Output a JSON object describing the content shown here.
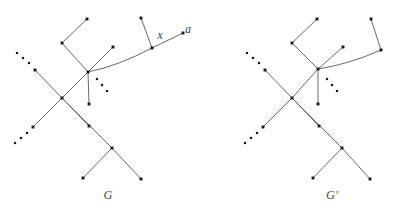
{
  "figure": {
    "width": 393,
    "height": 213,
    "background": "#ffffff",
    "edge_color": "#57575c",
    "node_color": "#18181c",
    "label_color": "#3a3a40"
  },
  "labels": {
    "vertex_x": "x",
    "vertex_a": "a",
    "caption_left": "G",
    "caption_right": "G′"
  },
  "graphs": [
    {
      "id": "graph-G",
      "caption": "G",
      "caption_pos": [
        108,
        199
      ],
      "hub": [
        88,
        72
      ],
      "nodes": [
        {
          "name": "upper-left-leaf",
          "pos": [
            87,
            19
          ]
        },
        {
          "name": "upper-left-elbow",
          "pos": [
            62,
            43
          ]
        },
        {
          "name": "upper-mid-leaf",
          "pos": [
            113,
            47
          ]
        },
        {
          "name": "hub",
          "pos": [
            88,
            72
          ]
        },
        {
          "name": "stem-leaf",
          "pos": [
            89,
            104
          ]
        },
        {
          "name": "branch-x",
          "pos": [
            152,
            48
          ]
        },
        {
          "name": "leaf-above-x",
          "pos": [
            141,
            18
          ]
        },
        {
          "name": "vertex-a",
          "pos": [
            183,
            33
          ]
        },
        {
          "name": "upper-chain-node",
          "pos": [
            35,
            70
          ]
        },
        {
          "name": "crossing-node",
          "pos": [
            62,
            98
          ]
        },
        {
          "name": "lower-chain-node",
          "pos": [
            33,
            127
          ]
        },
        {
          "name": "mid-lower-node",
          "pos": [
            89,
            126
          ]
        },
        {
          "name": "fork-node",
          "pos": [
            112,
            148
          ]
        },
        {
          "name": "fork-leaf-left",
          "pos": [
            83,
            178
          ]
        },
        {
          "name": "fork-leaf-right",
          "pos": [
            141,
            179
          ]
        }
      ],
      "edges": [
        {
          "name": "edge-upperleft-leaf-elbow",
          "from": [
            87,
            19
          ],
          "to": [
            62,
            43
          ]
        },
        {
          "name": "edge-elbow-hub",
          "from": [
            62,
            43
          ],
          "to": [
            88,
            72
          ]
        },
        {
          "name": "edge-uppermid-leaf-hub",
          "from": [
            113,
            47
          ],
          "to": [
            88,
            72
          ]
        },
        {
          "name": "edge-hub-stem-leaf",
          "from": [
            88,
            72
          ],
          "to": [
            89,
            104
          ]
        },
        {
          "name": "edge-leaf-above-x",
          "from": [
            141,
            18
          ],
          "to": [
            152,
            48
          ]
        },
        {
          "name": "edge-x-to-a",
          "from": [
            152,
            48
          ],
          "to": [
            183,
            33
          ]
        },
        {
          "name": "edge-hub-to-x-curve",
          "from": [
            88,
            72
          ],
          "to": [
            152,
            48
          ],
          "curve": [
            118,
            66
          ]
        },
        {
          "name": "edge-upperchain-crossing",
          "from": [
            35,
            70
          ],
          "to": [
            62,
            98
          ]
        },
        {
          "name": "edge-crossing-hub",
          "from": [
            62,
            98
          ],
          "to": [
            88,
            72
          ]
        },
        {
          "name": "edge-crossing-lowerchain",
          "from": [
            62,
            98
          ],
          "to": [
            33,
            127
          ]
        },
        {
          "name": "edge-crossing-midlower",
          "from": [
            62,
            98
          ],
          "to": [
            112,
            148
          ]
        },
        {
          "name": "edge-midlower-hub-diag",
          "from": [
            89,
            126
          ],
          "to": [
            62,
            98
          ]
        },
        {
          "name": "edge-fork-leaf-left",
          "from": [
            112,
            148
          ],
          "to": [
            83,
            178
          ]
        },
        {
          "name": "edge-fork-leaf-right",
          "from": [
            112,
            148
          ],
          "to": [
            141,
            179
          ]
        }
      ],
      "ellipses": [
        {
          "name": "ellipsis-upper-left",
          "dots": [
            [
              17,
              53
            ],
            [
              23,
              58
            ],
            [
              29,
              63
            ]
          ]
        },
        {
          "name": "ellipsis-lower-left",
          "dots": [
            [
              27,
              133
            ],
            [
              21,
              138
            ],
            [
              15,
              143
            ]
          ]
        },
        {
          "name": "ellipsis-hub-right",
          "dots": [
            [
              97,
              79
            ],
            [
              102,
              85
            ],
            [
              107,
              91
            ]
          ]
        }
      ]
    },
    {
      "id": "graph-G-prime",
      "caption": "G′",
      "caption_pos": [
        332,
        199
      ],
      "hub": [
        318,
        69
      ],
      "nodes": [
        {
          "name": "upper-left-leaf",
          "pos": [
            317,
            19
          ]
        },
        {
          "name": "upper-left-elbow",
          "pos": [
            292,
            43
          ]
        },
        {
          "name": "upper-mid-leaf",
          "pos": [
            343,
            47
          ]
        },
        {
          "name": "hub",
          "pos": [
            318,
            69
          ]
        },
        {
          "name": "stem-leaf",
          "pos": [
            318,
            104
          ]
        },
        {
          "name": "right-bend-node",
          "pos": [
            381,
            50
          ]
        },
        {
          "name": "right-top-leaf",
          "pos": [
            371,
            19
          ]
        },
        {
          "name": "upper-chain-node",
          "pos": [
            265,
            70
          ]
        },
        {
          "name": "crossing-node",
          "pos": [
            292,
            98
          ]
        },
        {
          "name": "lower-chain-node",
          "pos": [
            263,
            127
          ]
        },
        {
          "name": "mid-lower-node",
          "pos": [
            319,
            126
          ]
        },
        {
          "name": "fork-node",
          "pos": [
            342,
            148
          ]
        },
        {
          "name": "fork-leaf-left",
          "pos": [
            313,
            178
          ]
        },
        {
          "name": "fork-leaf-right",
          "pos": [
            370,
            179
          ]
        }
      ],
      "edges": [
        {
          "name": "edge-upperleft-leaf-elbow",
          "from": [
            317,
            19
          ],
          "to": [
            292,
            43
          ]
        },
        {
          "name": "edge-elbow-hub",
          "from": [
            292,
            43
          ],
          "to": [
            318,
            69
          ]
        },
        {
          "name": "edge-uppermid-leaf-hub",
          "from": [
            343,
            47
          ],
          "to": [
            318,
            69
          ]
        },
        {
          "name": "edge-hub-stem-leaf",
          "from": [
            318,
            69
          ],
          "to": [
            318,
            104
          ]
        },
        {
          "name": "edge-right-top-leaf-bend",
          "from": [
            371,
            19
          ],
          "to": [
            381,
            50
          ]
        },
        {
          "name": "edge-hub-to-bend-curve",
          "from": [
            318,
            69
          ],
          "to": [
            381,
            50
          ],
          "curve": [
            350,
            64
          ]
        },
        {
          "name": "edge-upperchain-crossing",
          "from": [
            265,
            70
          ],
          "to": [
            292,
            98
          ]
        },
        {
          "name": "edge-crossing-hub",
          "from": [
            292,
            98
          ],
          "to": [
            318,
            69
          ]
        },
        {
          "name": "edge-crossing-lowerchain",
          "from": [
            292,
            98
          ],
          "to": [
            263,
            127
          ]
        },
        {
          "name": "edge-crossing-midlower",
          "from": [
            292,
            98
          ],
          "to": [
            342,
            148
          ]
        },
        {
          "name": "edge-midlower-crossing",
          "from": [
            319,
            126
          ],
          "to": [
            292,
            98
          ]
        },
        {
          "name": "edge-fork-leaf-left",
          "from": [
            342,
            148
          ],
          "to": [
            313,
            178
          ]
        },
        {
          "name": "edge-fork-leaf-right",
          "from": [
            342,
            148
          ],
          "to": [
            370,
            179
          ]
        }
      ],
      "ellipses": [
        {
          "name": "ellipsis-upper-left",
          "dots": [
            [
              247,
              53
            ],
            [
              253,
              58
            ],
            [
              259,
              63
            ]
          ]
        },
        {
          "name": "ellipsis-lower-left",
          "dots": [
            [
              257,
              133
            ],
            [
              251,
              138
            ],
            [
              245,
              143
            ]
          ]
        },
        {
          "name": "ellipsis-hub-right",
          "dots": [
            [
              327,
              79
            ],
            [
              332,
              85
            ],
            [
              337,
              91
            ]
          ]
        }
      ]
    }
  ],
  "annotations": [
    {
      "name": "label-x",
      "text": "x",
      "pos": [
        160,
        39
      ]
    },
    {
      "name": "label-a",
      "text": "a",
      "pos": [
        188,
        33
      ]
    }
  ]
}
